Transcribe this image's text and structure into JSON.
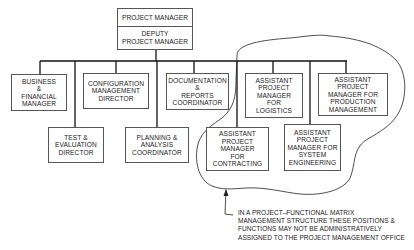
{
  "diagram": {
    "type": "organization-chart",
    "top": {
      "title": "PROJECT MANAGER",
      "deputy": "DEPUTY\nPROJECT MANAGER"
    },
    "units": [
      {
        "id": "business",
        "label": "BUSINESS\n&\nFINANCIAL\nMANAGER",
        "row": 1
      },
      {
        "id": "configuration",
        "label": "CONFIGURATION\nMANAGEMENT\nDIRECTOR",
        "row": 1
      },
      {
        "id": "documentation",
        "label": "DOCUMENTATION\n&\nREPORTS\nCOORDINATOR",
        "row": 1
      },
      {
        "id": "logistics",
        "label": "ASSISTANT\nPROJECT\nMANAGER\nFOR\nLOGISTICS",
        "row": 1
      },
      {
        "id": "production",
        "label": "ASSISTANT\nPROJECT\nMANAGER FOR\nPRODUCTION\nMANAGEMENT",
        "row": 1
      },
      {
        "id": "test",
        "label": "TEST &\nEVALUATION\nDIRECTOR",
        "row": 2
      },
      {
        "id": "planning",
        "label": "PLANNING &\nANALYSIS\nCOORDINATOR",
        "row": 2
      },
      {
        "id": "contracting",
        "label": "ASSISTANT\nPROJECT\nMANAGER\nFOR\nCONTRACTING",
        "row": 2
      },
      {
        "id": "systems",
        "label": "ASSISTANT\nPROJECT\nMANAGER FOR\nSYSTEM\nENGINEERING",
        "row": 2
      }
    ],
    "note": "IN A PROJECT–FUNCTIONAL MATRIX\nMANAGEMENT STRUCTURE THESE POSITIONS &\nFUNCTIONS MAY NOT BE ADMINISTRATIVELY\nASSIGNED TO THE PROJECT MANAGEMENT OFFICE",
    "colors": {
      "line": "#111111",
      "border": "#555555",
      "background": "#ffffff"
    }
  }
}
